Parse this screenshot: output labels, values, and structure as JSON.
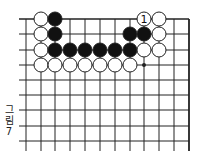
{
  "figure": {
    "caption_chars": [
      "그",
      "림",
      "7"
    ],
    "caption": "그림 7"
  },
  "board": {
    "line_color": "#222222",
    "black_color": "#111111",
    "white_fill": "#ffffff",
    "columns_x": [
      26,
      41,
      55,
      70,
      85,
      100,
      115,
      130,
      144,
      159,
      174
    ],
    "right_edge_x": 189,
    "rows_y": [
      19,
      34,
      50,
      65,
      80,
      95,
      110,
      126,
      141
    ],
    "left_stub_x": 19,
    "bottom_y": 151,
    "stone_radius": 7,
    "stones": [
      {
        "color": "white",
        "col": 1,
        "row": 0
      },
      {
        "color": "black",
        "col": 2,
        "row": 0
      },
      {
        "color": "white",
        "col": 8,
        "row": 0,
        "label": "1"
      },
      {
        "color": "white",
        "col": 9,
        "row": 0
      },
      {
        "color": "white",
        "col": 1,
        "row": 1
      },
      {
        "color": "black",
        "col": 2,
        "row": 1
      },
      {
        "color": "black",
        "col": 7,
        "row": 1
      },
      {
        "color": "black",
        "col": 8,
        "row": 1
      },
      {
        "color": "white",
        "col": 9,
        "row": 1
      },
      {
        "color": "white",
        "col": 1,
        "row": 2
      },
      {
        "color": "black",
        "col": 2,
        "row": 2
      },
      {
        "color": "black",
        "col": 3,
        "row": 2
      },
      {
        "color": "black",
        "col": 4,
        "row": 2
      },
      {
        "color": "black",
        "col": 5,
        "row": 2
      },
      {
        "color": "black",
        "col": 6,
        "row": 2
      },
      {
        "color": "black",
        "col": 7,
        "row": 2
      },
      {
        "color": "white",
        "col": 8,
        "row": 2
      },
      {
        "color": "white",
        "col": 9,
        "row": 2
      },
      {
        "color": "white",
        "col": 1,
        "row": 3
      },
      {
        "color": "white",
        "col": 2,
        "row": 3
      },
      {
        "color": "white",
        "col": 3,
        "row": 3
      },
      {
        "color": "white",
        "col": 4,
        "row": 3
      },
      {
        "color": "white",
        "col": 5,
        "row": 3
      },
      {
        "color": "white",
        "col": 6,
        "row": 3
      },
      {
        "color": "white",
        "col": 7,
        "row": 3
      }
    ],
    "markers": [
      {
        "type": "dot",
        "col": 8,
        "row": 3
      }
    ]
  }
}
